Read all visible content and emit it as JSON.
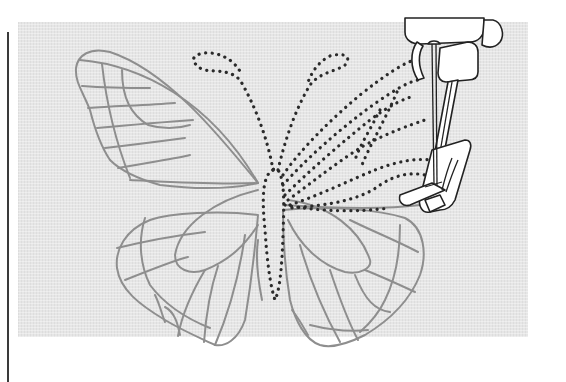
{
  "illustration": {
    "subject": "butterfly embroidery pattern being stitched by sewing machine",
    "elements": {
      "fabric": "fabric-background",
      "butterfly_outline": "butterfly-outline-pattern",
      "stitched_lines": "dotted-stitch-lines",
      "presser_foot": "sewing-machine-presser-foot",
      "needle": "sewing-needle"
    },
    "colors": {
      "fabric": "#e6e6e6",
      "pattern_outline": "#8e8e8e",
      "stitches": "#2a2a2a",
      "machine_outline": "#222222"
    }
  }
}
